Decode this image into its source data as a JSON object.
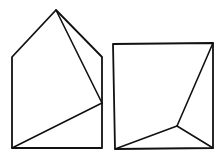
{
  "figures": [
    {
      "name": "pentagon-house-shape",
      "outline": [
        [
          56,
          10
        ],
        [
          102,
          57
        ],
        [
          102,
          148
        ],
        [
          12,
          148
        ],
        [
          12,
          57
        ]
      ],
      "lines": [
        [
          [
            56,
            10
          ],
          [
            102,
            103
          ]
        ],
        [
          [
            12,
            148
          ],
          [
            102,
            103
          ]
        ]
      ]
    },
    {
      "name": "square-shape",
      "outline": [
        [
          113,
          44
        ],
        [
          213,
          43
        ],
        [
          213,
          148
        ],
        [
          115,
          149
        ]
      ],
      "lines": [
        [
          [
            213,
            43
          ],
          [
            177,
            126
          ]
        ],
        [
          [
            177,
            126
          ],
          [
            115,
            149
          ]
        ],
        [
          [
            177,
            126
          ],
          [
            213,
            148
          ]
        ]
      ]
    }
  ],
  "colors": {
    "stroke": "#111111",
    "background": "#ffffff"
  }
}
